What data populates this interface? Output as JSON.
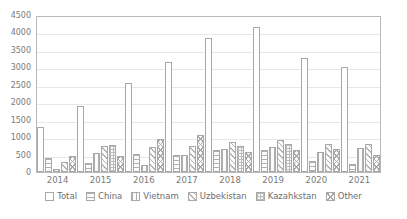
{
  "chart_data": {
    "type": "bar",
    "title": "",
    "subtitle": "",
    "xlabel": "",
    "ylabel": "",
    "ylim": [
      0,
      4500
    ],
    "ytick_step": 500,
    "yticks": [
      "4500",
      "4000",
      "3500",
      "3000",
      "2500",
      "2000",
      "1500",
      "1000",
      "500",
      "0"
    ],
    "grid": true,
    "grid_axis": "y",
    "legend_position": "bottom",
    "categories": [
      "2014",
      "2015",
      "2016",
      "2017",
      "2018",
      "2019",
      "2020",
      "2021"
    ],
    "series": [
      {
        "name": "Total",
        "pattern": "solid-white",
        "values": [
          1300,
          1880,
          2560,
          3140,
          3830,
          4170,
          3270,
          3020
        ]
      },
      {
        "name": "China",
        "pattern": "horizontal-lines",
        "values": [
          400,
          250,
          520,
          500,
          620,
          620,
          330,
          220
        ]
      },
      {
        "name": "Vietnam",
        "pattern": "vertical-lines",
        "values": [
          90,
          540,
          200,
          490,
          660,
          720,
          580,
          690
        ]
      },
      {
        "name": "Uzbekistan",
        "pattern": "diagonal-lines",
        "values": [
          290,
          740,
          720,
          760,
          860,
          930,
          790,
          800
        ]
      },
      {
        "name": "Kazahkstan",
        "pattern": "fine-grid",
        "values": [
          0,
          780,
          0,
          0,
          760,
          810,
          0,
          0
        ]
      },
      {
        "name": "Other",
        "pattern": "crosshatch",
        "values": [
          450,
          470,
          950,
          1070,
          560,
          640,
          660,
          490
        ]
      }
    ]
  },
  "legend": {
    "items": [
      {
        "label": "Total",
        "pattern_class": "pat-total"
      },
      {
        "label": "China",
        "pattern_class": "pat-china"
      },
      {
        "label": "Vietnam",
        "pattern_class": "pat-vietnam"
      },
      {
        "label": "Uzbekistan",
        "pattern_class": "pat-uzbekistan"
      },
      {
        "label": "Kazahkstan",
        "pattern_class": "pat-kazahkstan"
      },
      {
        "label": "Other",
        "pattern_class": "pat-other"
      }
    ]
  },
  "colors": {
    "plot_border": "#b9b9b9",
    "gridline": "#e8e8e8",
    "bar_outline": "#a8a8a8",
    "text": "#6e6e6e",
    "background": "#ffffff"
  }
}
